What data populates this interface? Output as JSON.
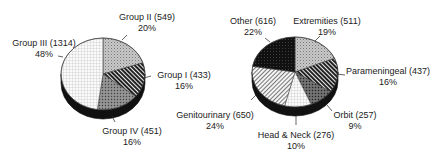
{
  "chart_data": [
    {
      "type": "pie",
      "title": "",
      "style": "3d",
      "slices": [
        {
          "label": "Group II",
          "count": 549,
          "percent": 20,
          "pattern": "dots-gray"
        },
        {
          "label": "Group I",
          "count": 433,
          "percent": 16,
          "pattern": "diag-dark"
        },
        {
          "label": "Group IV",
          "count": 451,
          "percent": 16,
          "pattern": "crosshatch-gray"
        },
        {
          "label": "Group III",
          "count": 1314,
          "percent": 48,
          "pattern": "grid-light"
        }
      ]
    },
    {
      "type": "pie",
      "title": "",
      "style": "3d",
      "slices": [
        {
          "label": "Extremities",
          "count": 511,
          "percent": 19,
          "pattern": "dots-gray"
        },
        {
          "label": "Parameningeal",
          "count": 437,
          "percent": 16,
          "pattern": "diag-dark"
        },
        {
          "label": "Orbit",
          "count": 257,
          "percent": 9,
          "pattern": "crosshatch-dark"
        },
        {
          "label": "Head & Neck",
          "count": 276,
          "percent": 10,
          "pattern": "grid-light"
        },
        {
          "label": "Genitourinary",
          "count": 650,
          "percent": 24,
          "pattern": "diag-light"
        },
        {
          "label": "Other",
          "count": 616,
          "percent": 22,
          "pattern": "solid-black"
        }
      ]
    }
  ],
  "labels": {
    "left": [
      {
        "name": "Group II (549)",
        "pct": "20%"
      },
      {
        "name": "Group I (433)",
        "pct": "16%"
      },
      {
        "name": "Group IV (451)",
        "pct": "16%"
      },
      {
        "name": "Group III (1314)",
        "pct": "48%"
      }
    ],
    "right": [
      {
        "name": "Extremities (511)",
        "pct": "19%"
      },
      {
        "name": "Parameningeal (437)",
        "pct": "16%"
      },
      {
        "name": "Orbit (257)",
        "pct": "9%"
      },
      {
        "name": "Head & Neck (276)",
        "pct": "10%"
      },
      {
        "name": "Genitourinary (650)",
        "pct": "24%"
      },
      {
        "name": "Other (616)",
        "pct": "22%"
      }
    ]
  }
}
